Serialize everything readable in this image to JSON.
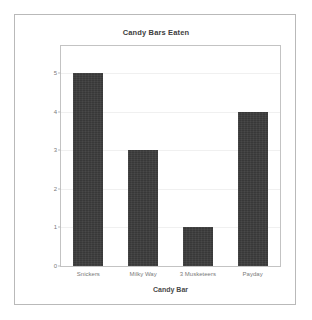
{
  "chart_data": {
    "type": "bar",
    "title": "Candy Bars Eaten",
    "xlabel": "Candy Bar",
    "ylabel": "Number Eaten",
    "categories": [
      "Snickers",
      "Milky Way",
      "3 Musketeers",
      "Payday"
    ],
    "values": [
      5,
      3,
      1,
      4
    ],
    "ylim": [
      0,
      5.7
    ],
    "yticks": [
      0,
      1,
      2,
      3,
      4,
      5
    ],
    "ytick_labels": [
      "0",
      "1",
      "2",
      "3",
      "4",
      "5"
    ],
    "grid": true,
    "legend": false,
    "bar_color": "#3c3c3c",
    "frame_color": "#c3c3c3",
    "background": "#ffffff"
  }
}
